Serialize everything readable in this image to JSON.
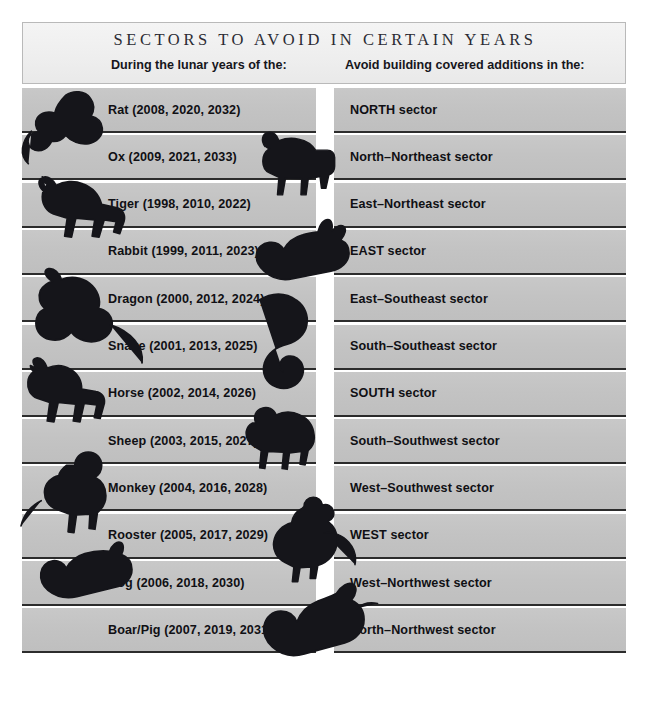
{
  "header": {
    "title": "SECTORS TO AVOID IN CERTAIN YEARS",
    "left_column_heading": "During the lunar years of the:",
    "right_column_heading": "Avoid building covered additions in the:"
  },
  "colors": {
    "page_background": "#ffffff",
    "header_panel": "#efefef",
    "header_border": "#b9b9b9",
    "row_band": "#c3c3c3",
    "row_rule": "#2c2c2c",
    "text": "#101014",
    "title_text": "#2b2b33",
    "artwork_ink": "#15151a"
  },
  "table": {
    "rows": [
      {
        "animal": "rat",
        "icon": "rat-icon",
        "years_label": "Rat (2008, 2020, 2032)",
        "sector": "NORTH sector"
      },
      {
        "animal": "ox",
        "icon": "ox-icon",
        "years_label": "Ox (2009, 2021, 2033)",
        "sector": "North–Northeast sector"
      },
      {
        "animal": "tiger",
        "icon": "tiger-icon",
        "years_label": "Tiger (1998, 2010, 2022)",
        "sector": "East–Northeast sector"
      },
      {
        "animal": "rabbit",
        "icon": "rabbit-icon",
        "years_label": "Rabbit (1999, 2011, 2023)",
        "sector": "EAST sector"
      },
      {
        "animal": "dragon",
        "icon": "dragon-icon",
        "years_label": "Dragon (2000, 2012, 2024)",
        "sector": "East–Southeast sector"
      },
      {
        "animal": "snake",
        "icon": "snake-icon",
        "years_label": "Snake (2001, 2013, 2025)",
        "sector": "South–Southeast sector"
      },
      {
        "animal": "horse",
        "icon": "horse-icon",
        "years_label": "Horse (2002, 2014, 2026)",
        "sector": "SOUTH sector"
      },
      {
        "animal": "sheep",
        "icon": "sheep-icon",
        "years_label": "Sheep (2003, 2015, 2027)",
        "sector": "South–Southwest sector"
      },
      {
        "animal": "monkey",
        "icon": "monkey-icon",
        "years_label": "Monkey (2004, 2016, 2028)",
        "sector": "West–Southwest sector"
      },
      {
        "animal": "rooster",
        "icon": "rooster-icon",
        "years_label": "Rooster (2005, 2017, 2029)",
        "sector": "WEST sector"
      },
      {
        "animal": "dog",
        "icon": "dog-icon",
        "years_label": "Dog (2006, 2018, 2030)",
        "sector": "West–Northwest sector"
      },
      {
        "animal": "boar",
        "icon": "boar-icon",
        "years_label": "Boar/Pig (2007, 2019, 2031)",
        "sector": "North–Northwest sector"
      }
    ]
  }
}
